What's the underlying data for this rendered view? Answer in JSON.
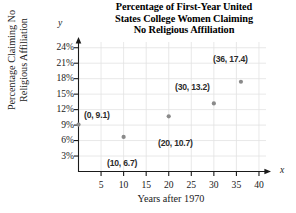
{
  "chart_data": {
    "type": "scatter",
    "title": "Percentage of First-Year United States College Women Claiming No Religious Affiliation",
    "title_lines": [
      "Percentage of First-Year United",
      "States College Women Claiming",
      "No Religious Affiliation"
    ],
    "xlabel": "Years after 1970",
    "ylabel": "Percentage Claiming No Religious Affiliation",
    "ylabel_lines": [
      "Percentage Claiming No",
      "Religious Affiliation"
    ],
    "x_axis_letter": "x",
    "y_axis_letter": "y",
    "xlim": [
      0,
      42
    ],
    "ylim": [
      0,
      25.5
    ],
    "xticks": [
      5,
      10,
      15,
      20,
      25,
      30,
      35,
      40
    ],
    "xtick_labels": [
      "5",
      "10",
      "15",
      "20",
      "25",
      "30",
      "35",
      "40"
    ],
    "yticks": [
      3,
      6,
      9,
      12,
      15,
      18,
      21,
      24
    ],
    "ytick_labels": [
      "3%",
      "6%",
      "9%",
      "12%",
      "15%",
      "18%",
      "21%",
      "24%"
    ],
    "grid": true,
    "grid_color": "#e2e2e2",
    "axis_color": "#1a1a1a",
    "marker_color": "#8a8a8a",
    "legend": null,
    "points": [
      {
        "x": 0,
        "y": 9.1,
        "label": "(0, 9.1)",
        "label_x": 84,
        "label_y": 110
      },
      {
        "x": 10,
        "y": 6.7,
        "label": "(10, 6.7)",
        "label_x": 107,
        "label_y": 158
      },
      {
        "x": 20,
        "y": 10.7,
        "label": "(20, 10.7)",
        "label_x": 158,
        "label_y": 138
      },
      {
        "x": 30,
        "y": 13.2,
        "label": "(30, 13.2)",
        "label_x": 175,
        "label_y": 82
      },
      {
        "x": 36,
        "y": 17.4,
        "label": "(36, 17.4)",
        "label_x": 213,
        "label_y": 54
      }
    ]
  }
}
